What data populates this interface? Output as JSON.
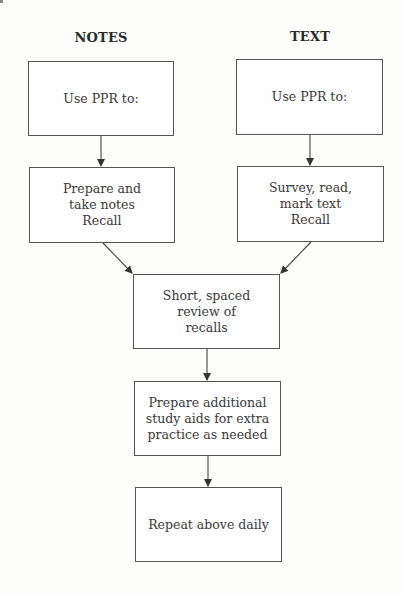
{
  "diagram": {
    "columns": [
      {
        "heading": "NOTES"
      },
      {
        "heading": "TEXT"
      }
    ],
    "nodes": {
      "notes_use_ppr": {
        "lines": [
          "Use PPR to:"
        ]
      },
      "text_use_ppr": {
        "lines": [
          "Use PPR to:"
        ]
      },
      "notes_prepare": {
        "lines": [
          "Prepare and",
          "take notes",
          "Recall"
        ]
      },
      "text_survey": {
        "lines": [
          "Survey, read,",
          "mark text",
          "Recall"
        ]
      },
      "review": {
        "lines": [
          "Short, spaced",
          "review of",
          "recalls"
        ]
      },
      "study_aids": {
        "lines": [
          "Prepare additional",
          "study aids for extra",
          "practice as needed"
        ]
      },
      "repeat": {
        "lines": [
          "Repeat above daily"
        ]
      }
    },
    "edges": [
      {
        "from": "notes_use_ppr",
        "to": "notes_prepare"
      },
      {
        "from": "text_use_ppr",
        "to": "text_survey"
      },
      {
        "from": "notes_prepare",
        "to": "review"
      },
      {
        "from": "text_survey",
        "to": "review"
      },
      {
        "from": "review",
        "to": "study_aids"
      },
      {
        "from": "study_aids",
        "to": "repeat"
      }
    ],
    "colors": {
      "border": "#555555",
      "text": "#3a3a3a",
      "arrow": "#333333",
      "background": "#fdfdfc"
    }
  }
}
